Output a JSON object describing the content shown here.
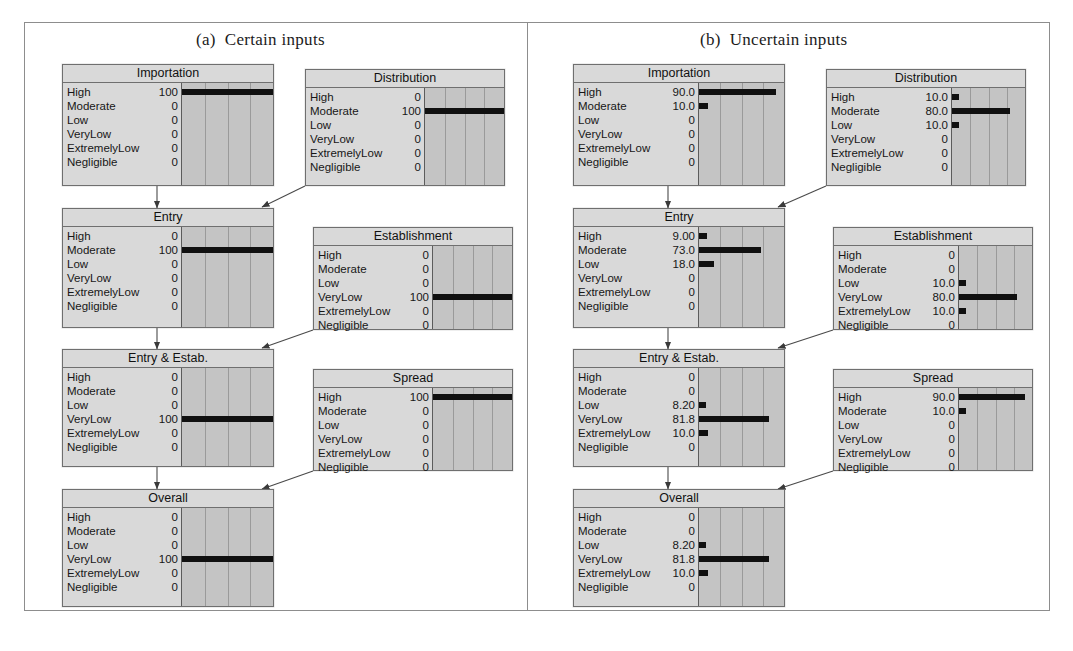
{
  "figure": {
    "states": [
      "High",
      "Moderate",
      "Low",
      "VeryLow",
      "ExtremelyLow",
      "Negligible"
    ],
    "axis_max": 100,
    "gridline_positions": [
      25,
      50,
      75
    ],
    "bar_color": "#101010",
    "node_fill": "#d9d9d9",
    "chart_fill": "#c4c4c4",
    "border_color": "#6f6f6f"
  },
  "panels": [
    {
      "id": "panel-a",
      "caption_letter": "(a)",
      "caption_text": "Certain inputs",
      "nodes": [
        {
          "id": "importation-a",
          "title": "Importation",
          "rows": [
            {
              "label": "High",
              "value": "100",
              "bar": 100
            },
            {
              "label": "Moderate",
              "value": "0",
              "bar": 0
            },
            {
              "label": "Low",
              "value": "0",
              "bar": 0
            },
            {
              "label": "VeryLow",
              "value": "0",
              "bar": 0
            },
            {
              "label": "ExtremelyLow",
              "value": "0",
              "bar": 0
            },
            {
              "label": "Negligible",
              "value": "0",
              "bar": 0
            }
          ]
        },
        {
          "id": "distribution-a",
          "title": "Distribution",
          "rows": [
            {
              "label": "High",
              "value": "0",
              "bar": 0
            },
            {
              "label": "Moderate",
              "value": "100",
              "bar": 100
            },
            {
              "label": "Low",
              "value": "0",
              "bar": 0
            },
            {
              "label": "VeryLow",
              "value": "0",
              "bar": 0
            },
            {
              "label": "ExtremelyLow",
              "value": "0",
              "bar": 0
            },
            {
              "label": "Negligible",
              "value": "0",
              "bar": 0
            }
          ]
        },
        {
          "id": "entry-a",
          "title": "Entry",
          "rows": [
            {
              "label": "High",
              "value": "0",
              "bar": 0
            },
            {
              "label": "Moderate",
              "value": "100",
              "bar": 100
            },
            {
              "label": "Low",
              "value": "0",
              "bar": 0
            },
            {
              "label": "VeryLow",
              "value": "0",
              "bar": 0
            },
            {
              "label": "ExtremelyLow",
              "value": "0",
              "bar": 0
            },
            {
              "label": "Negligible",
              "value": "0",
              "bar": 0
            }
          ]
        },
        {
          "id": "establishment-a",
          "title": "Establishment",
          "rows": [
            {
              "label": "High",
              "value": "0",
              "bar": 0
            },
            {
              "label": "Moderate",
              "value": "0",
              "bar": 0
            },
            {
              "label": "Low",
              "value": "0",
              "bar": 0
            },
            {
              "label": "VeryLow",
              "value": "100",
              "bar": 100
            },
            {
              "label": "ExtremelyLow",
              "value": "0",
              "bar": 0
            },
            {
              "label": "Negligible",
              "value": "0",
              "bar": 0
            }
          ]
        },
        {
          "id": "entry-estab-a",
          "title": "Entry & Estab.",
          "rows": [
            {
              "label": "High",
              "value": "0",
              "bar": 0
            },
            {
              "label": "Moderate",
              "value": "0",
              "bar": 0
            },
            {
              "label": "Low",
              "value": "0",
              "bar": 0
            },
            {
              "label": "VeryLow",
              "value": "100",
              "bar": 100
            },
            {
              "label": "ExtremelyLow",
              "value": "0",
              "bar": 0
            },
            {
              "label": "Negligible",
              "value": "0",
              "bar": 0
            }
          ]
        },
        {
          "id": "spread-a",
          "title": "Spread",
          "rows": [
            {
              "label": "High",
              "value": "100",
              "bar": 100
            },
            {
              "label": "Moderate",
              "value": "0",
              "bar": 0
            },
            {
              "label": "Low",
              "value": "0",
              "bar": 0
            },
            {
              "label": "VeryLow",
              "value": "0",
              "bar": 0
            },
            {
              "label": "ExtremelyLow",
              "value": "0",
              "bar": 0
            },
            {
              "label": "Negligible",
              "value": "0",
              "bar": 0
            }
          ]
        },
        {
          "id": "overall-a",
          "title": "Overall",
          "rows": [
            {
              "label": "High",
              "value": "0",
              "bar": 0
            },
            {
              "label": "Moderate",
              "value": "0",
              "bar": 0
            },
            {
              "label": "Low",
              "value": "0",
              "bar": 0
            },
            {
              "label": "VeryLow",
              "value": "100",
              "bar": 100
            },
            {
              "label": "ExtremelyLow",
              "value": "0",
              "bar": 0
            },
            {
              "label": "Negligible",
              "value": "0",
              "bar": 0
            }
          ]
        }
      ]
    },
    {
      "id": "panel-b",
      "caption_letter": "(b)",
      "caption_text": "Uncertain inputs",
      "nodes": [
        {
          "id": "importation-b",
          "title": "Importation",
          "rows": [
            {
              "label": "High",
              "value": "90.0",
              "bar": 90
            },
            {
              "label": "Moderate",
              "value": "10.0",
              "bar": 10
            },
            {
              "label": "Low",
              "value": "0",
              "bar": 0
            },
            {
              "label": "VeryLow",
              "value": "0",
              "bar": 0
            },
            {
              "label": "ExtremelyLow",
              "value": "0",
              "bar": 0
            },
            {
              "label": "Negligible",
              "value": "0",
              "bar": 0
            }
          ]
        },
        {
          "id": "distribution-b",
          "title": "Distribution",
          "rows": [
            {
              "label": "High",
              "value": "10.0",
              "bar": 10
            },
            {
              "label": "Moderate",
              "value": "80.0",
              "bar": 80
            },
            {
              "label": "Low",
              "value": "10.0",
              "bar": 10
            },
            {
              "label": "VeryLow",
              "value": "0",
              "bar": 0
            },
            {
              "label": "ExtremelyLow",
              "value": "0",
              "bar": 0
            },
            {
              "label": "Negligible",
              "value": "0",
              "bar": 0
            }
          ]
        },
        {
          "id": "entry-b",
          "title": "Entry",
          "rows": [
            {
              "label": "High",
              "value": "9.00",
              "bar": 9
            },
            {
              "label": "Moderate",
              "value": "73.0",
              "bar": 73
            },
            {
              "label": "Low",
              "value": "18.0",
              "bar": 18
            },
            {
              "label": "VeryLow",
              "value": "0",
              "bar": 0
            },
            {
              "label": "ExtremelyLow",
              "value": "0",
              "bar": 0
            },
            {
              "label": "Negligible",
              "value": "0",
              "bar": 0
            }
          ]
        },
        {
          "id": "establishment-b",
          "title": "Establishment",
          "rows": [
            {
              "label": "High",
              "value": "0",
              "bar": 0
            },
            {
              "label": "Moderate",
              "value": "0",
              "bar": 0
            },
            {
              "label": "Low",
              "value": "10.0",
              "bar": 10
            },
            {
              "label": "VeryLow",
              "value": "80.0",
              "bar": 80
            },
            {
              "label": "ExtremelyLow",
              "value": "10.0",
              "bar": 10
            },
            {
              "label": "Negligible",
              "value": "0",
              "bar": 0
            }
          ]
        },
        {
          "id": "entry-estab-b",
          "title": "Entry & Estab.",
          "rows": [
            {
              "label": "High",
              "value": "0",
              "bar": 0
            },
            {
              "label": "Moderate",
              "value": "0",
              "bar": 0
            },
            {
              "label": "Low",
              "value": "8.20",
              "bar": 8.2
            },
            {
              "label": "VeryLow",
              "value": "81.8",
              "bar": 81.8
            },
            {
              "label": "ExtremelyLow",
              "value": "10.0",
              "bar": 10
            },
            {
              "label": "Negligible",
              "value": "0",
              "bar": 0
            }
          ]
        },
        {
          "id": "spread-b",
          "title": "Spread",
          "rows": [
            {
              "label": "High",
              "value": "90.0",
              "bar": 90
            },
            {
              "label": "Moderate",
              "value": "10.0",
              "bar": 10
            },
            {
              "label": "Low",
              "value": "0",
              "bar": 0
            },
            {
              "label": "VeryLow",
              "value": "0",
              "bar": 0
            },
            {
              "label": "ExtremelyLow",
              "value": "0",
              "bar": 0
            },
            {
              "label": "Negligible",
              "value": "0",
              "bar": 0
            }
          ]
        },
        {
          "id": "overall-b",
          "title": "Overall",
          "rows": [
            {
              "label": "High",
              "value": "0",
              "bar": 0
            },
            {
              "label": "Moderate",
              "value": "0",
              "bar": 0
            },
            {
              "label": "Low",
              "value": "8.20",
              "bar": 8.2
            },
            {
              "label": "VeryLow",
              "value": "81.8",
              "bar": 81.8
            },
            {
              "label": "ExtremelyLow",
              "value": "10.0",
              "bar": 10
            },
            {
              "label": "Negligible",
              "value": "0",
              "bar": 0
            }
          ]
        }
      ]
    }
  ],
  "chart_data": {
    "type": "bar",
    "xlabel": "",
    "ylabel": "",
    "xlim": [
      0,
      100
    ],
    "grid": true,
    "legend": "none",
    "categories": [
      "High",
      "Moderate",
      "Low",
      "VeryLow",
      "ExtremelyLow",
      "Negligible"
    ],
    "panels": [
      {
        "name": "(a) Certain inputs",
        "series": [
          {
            "name": "Importation",
            "values": [
              100,
              0,
              0,
              0,
              0,
              0
            ]
          },
          {
            "name": "Distribution",
            "values": [
              0,
              100,
              0,
              0,
              0,
              0
            ]
          },
          {
            "name": "Entry",
            "values": [
              0,
              100,
              0,
              0,
              0,
              0
            ]
          },
          {
            "name": "Establishment",
            "values": [
              0,
              0,
              0,
              100,
              0,
              0
            ]
          },
          {
            "name": "Entry & Estab.",
            "values": [
              0,
              0,
              0,
              100,
              0,
              0
            ]
          },
          {
            "name": "Spread",
            "values": [
              100,
              0,
              0,
              0,
              0,
              0
            ]
          },
          {
            "name": "Overall",
            "values": [
              0,
              0,
              0,
              100,
              0,
              0
            ]
          }
        ]
      },
      {
        "name": "(b) Uncertain inputs",
        "series": [
          {
            "name": "Importation",
            "values": [
              90.0,
              10.0,
              0,
              0,
              0,
              0
            ]
          },
          {
            "name": "Distribution",
            "values": [
              10.0,
              80.0,
              10.0,
              0,
              0,
              0
            ]
          },
          {
            "name": "Entry",
            "values": [
              9.0,
              73.0,
              18.0,
              0,
              0,
              0
            ]
          },
          {
            "name": "Establishment",
            "values": [
              0,
              0,
              10.0,
              80.0,
              10.0,
              0
            ]
          },
          {
            "name": "Entry & Estab.",
            "values": [
              0,
              0,
              8.2,
              81.8,
              10.0,
              0
            ]
          },
          {
            "name": "Spread",
            "values": [
              90.0,
              10.0,
              0,
              0,
              0,
              0
            ]
          },
          {
            "name": "Overall",
            "values": [
              0,
              0,
              8.2,
              81.8,
              10.0,
              0
            ]
          }
        ]
      }
    ]
  }
}
